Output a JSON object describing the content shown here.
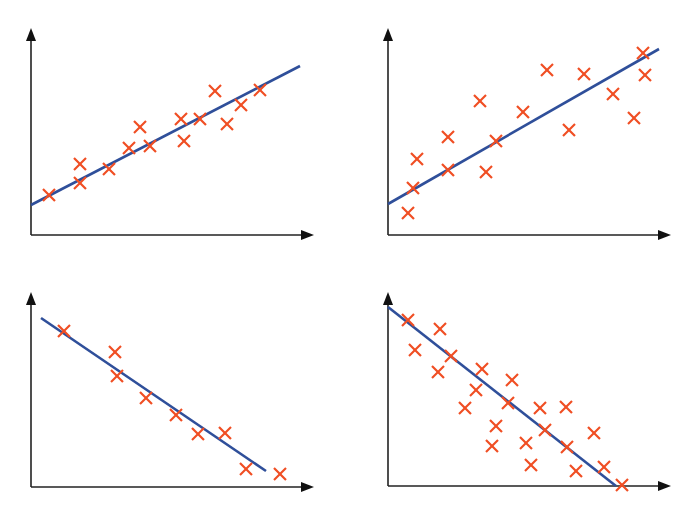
{
  "figure": {
    "width": 698,
    "height": 505,
    "colors": {
      "axis": "#222222",
      "marker": "#f04e23",
      "fit_line": "#2f4f9a",
      "background": "#ffffff"
    },
    "marker_icon": "cross-x-marker",
    "axis_icon": "arrow-axis"
  },
  "chart_data": [
    {
      "id": "top-left",
      "type": "scatter",
      "title": "",
      "xlabel": "",
      "ylabel": "",
      "description": "Positive linear correlation, tight fit",
      "grid": false,
      "axes_px": {
        "origin": [
          31,
          235
        ],
        "y_top": [
          31,
          28
        ],
        "x_right": [
          314,
          235
        ]
      },
      "fit_line_px": [
        [
          31,
          205
        ],
        [
          300,
          66
        ]
      ],
      "points_px": [
        [
          49,
          195
        ],
        [
          80,
          164
        ],
        [
          80,
          183
        ],
        [
          109,
          169
        ],
        [
          129,
          148
        ],
        [
          140,
          127
        ],
        [
          150,
          146
        ],
        [
          181,
          119
        ],
        [
          184,
          141
        ],
        [
          200,
          119
        ],
        [
          215,
          91
        ],
        [
          227,
          124
        ],
        [
          241,
          105
        ],
        [
          260,
          90
        ]
      ]
    },
    {
      "id": "top-right",
      "type": "scatter",
      "title": "",
      "xlabel": "",
      "ylabel": "",
      "description": "Positive linear correlation, loose fit",
      "grid": false,
      "axes_px": {
        "origin": [
          388,
          235
        ],
        "y_top": [
          388,
          28
        ],
        "x_right": [
          671,
          235
        ]
      },
      "fit_line_px": [
        [
          388,
          204
        ],
        [
          659,
          49
        ]
      ],
      "points_px": [
        [
          408,
          213
        ],
        [
          413,
          188
        ],
        [
          417,
          159
        ],
        [
          448,
          170
        ],
        [
          448,
          137
        ],
        [
          480,
          101
        ],
        [
          486,
          172
        ],
        [
          496,
          141
        ],
        [
          523,
          112
        ],
        [
          547,
          70
        ],
        [
          569,
          130
        ],
        [
          584,
          74
        ],
        [
          613,
          94
        ],
        [
          634,
          118
        ],
        [
          643,
          53
        ],
        [
          645,
          75
        ]
      ]
    },
    {
      "id": "bottom-left",
      "type": "scatter",
      "title": "",
      "xlabel": "",
      "ylabel": "",
      "description": "Negative linear correlation, tight fit",
      "grid": false,
      "axes_px": {
        "origin": [
          31,
          487
        ],
        "y_top": [
          31,
          292
        ],
        "x_right": [
          314,
          487
        ]
      },
      "fit_line_px": [
        [
          41,
          318
        ],
        [
          266,
          471
        ]
      ],
      "points_px": [
        [
          64,
          331
        ],
        [
          115,
          352
        ],
        [
          117,
          376
        ],
        [
          146,
          398
        ],
        [
          176,
          415
        ],
        [
          198,
          434
        ],
        [
          225,
          433
        ],
        [
          246,
          469
        ],
        [
          280,
          474
        ]
      ]
    },
    {
      "id": "bottom-right",
      "type": "scatter",
      "title": "",
      "xlabel": "",
      "ylabel": "",
      "description": "Negative linear correlation, loose fit",
      "grid": false,
      "axes_px": {
        "origin": [
          388,
          486
        ],
        "y_top": [
          388,
          292
        ],
        "x_right": [
          671,
          486
        ]
      },
      "fit_line_px": [
        [
          388,
          307
        ],
        [
          616,
          486
        ]
      ],
      "points_px": [
        [
          408,
          320
        ],
        [
          415,
          350
        ],
        [
          440,
          329
        ],
        [
          438,
          372
        ],
        [
          451,
          356
        ],
        [
          482,
          369
        ],
        [
          476,
          390
        ],
        [
          465,
          408
        ],
        [
          512,
          380
        ],
        [
          508,
          403
        ],
        [
          496,
          426
        ],
        [
          492,
          446
        ],
        [
          540,
          408
        ],
        [
          566,
          407
        ],
        [
          545,
          430
        ],
        [
          526,
          443
        ],
        [
          531,
          465
        ],
        [
          594,
          433
        ],
        [
          567,
          447
        ],
        [
          576,
          471
        ],
        [
          604,
          467
        ],
        [
          622,
          485
        ]
      ]
    }
  ]
}
